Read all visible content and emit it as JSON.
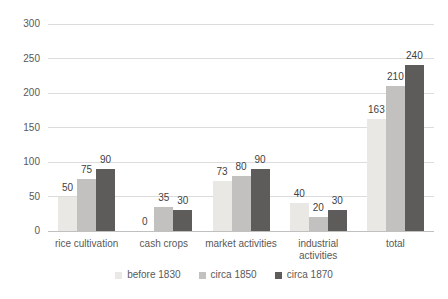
{
  "chart_data": {
    "type": "bar",
    "title": "",
    "xlabel": "",
    "ylabel": "",
    "categories": [
      "rice cultivation",
      "cash crops",
      "market activities",
      "industrial activities",
      "total"
    ],
    "series": [
      {
        "name": "before 1830",
        "color": "#e9e8e4",
        "values": [
          50,
          0,
          73,
          40,
          163
        ]
      },
      {
        "name": "circa 1850",
        "color": "#c2c1bf",
        "values": [
          75,
          35,
          80,
          20,
          210
        ]
      },
      {
        "name": "circa 1870",
        "color": "#5d5c5b",
        "values": [
          90,
          30,
          90,
          30,
          240
        ]
      }
    ],
    "ylim": [
      0,
      300
    ],
    "yticks": [
      0,
      50,
      100,
      150,
      200,
      250,
      300
    ],
    "grid": true,
    "value_labels": true,
    "legend_position": "bottom"
  },
  "styles": {
    "background": "#ffffff",
    "grid_color": "#dcdcdc",
    "axis_line_color": "#c0c0c0",
    "tick_label_color": "#595959",
    "category_label_color": "#595959",
    "value_label_color": "#3f3f3f",
    "legend_text_color": "#595959"
  }
}
